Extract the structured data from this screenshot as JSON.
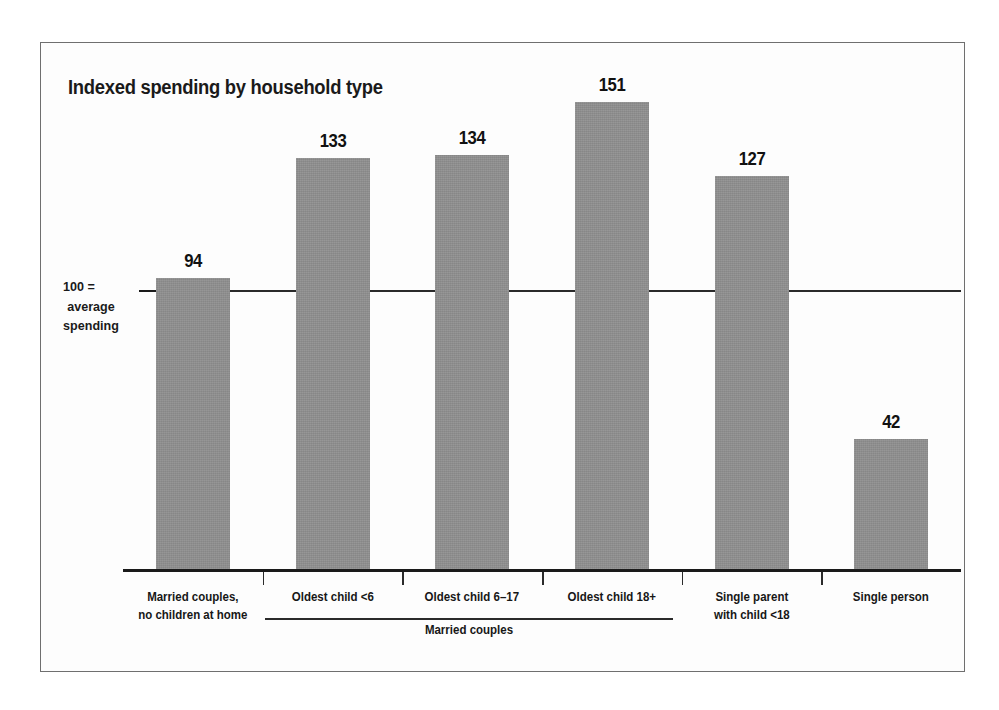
{
  "figure": {
    "title": "Indexed spending by household type",
    "axis_note_lines": [
      "100 =",
      "average",
      "spending"
    ],
    "group_bracket_label": "Married couples",
    "frame_color": "#6f6f6f",
    "bar_color": "#8e8e8e",
    "text_color": "#171717",
    "reference_line_color": "#2a2a2a"
  },
  "chart_data": {
    "type": "bar",
    "title": "Indexed spending by household type",
    "subtitle": "",
    "xlabel": "",
    "ylabel": "Indexed spending (100 = average spending)",
    "categories": [
      "Married couples, no children at home",
      "Oldest child <6",
      "Oldest child 6–17",
      "Oldest child 18+",
      "Single parent with child <18",
      "Single person"
    ],
    "category_label_lines": [
      [
        "Married couples,",
        "no children at home"
      ],
      [
        "Oldest child <6"
      ],
      [
        "Oldest child 6–17"
      ],
      [
        "Oldest child 18+"
      ],
      [
        "Single parent",
        "with child <18"
      ],
      [
        "Single person"
      ]
    ],
    "values": [
      94,
      133,
      134,
      151,
      127,
      42
    ],
    "value_labels": [
      "94",
      "133",
      "134",
      "151",
      "127",
      "42"
    ],
    "reference_line": 100,
    "reference_line_label": "100 = average spending",
    "ylim": [
      0,
      163
    ],
    "grid": false,
    "legend": "none",
    "groups": [
      {
        "label": "Married couples",
        "member_categories": [
          "Oldest child <6",
          "Oldest child 6–17",
          "Oldest child 18+"
        ]
      }
    ]
  }
}
